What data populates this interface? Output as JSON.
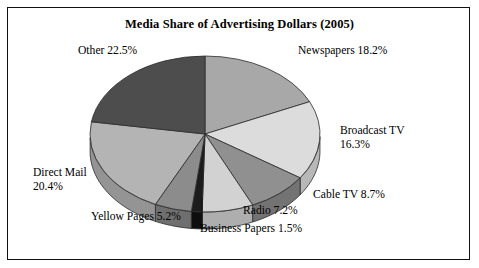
{
  "figure": {
    "title": "Media Share of Advertising Dollars (2005)",
    "frame_color": "#111111",
    "background": "#ffffff"
  },
  "labels": {
    "other": "Other 22.5%",
    "newspapers": "Newspapers 18.2%",
    "broadcast_tv_line1": "Broadcast TV",
    "broadcast_tv_line2": "16.3%",
    "cable_tv": "Cable TV 8.7%",
    "radio": "Radio 7.2%",
    "business_papers": "Business Papers 1.5%",
    "yellow_pages": "Yellow Pages 5.2%",
    "direct_mail_line1": "Direct Mail",
    "direct_mail_line2": "20.4%"
  },
  "chart_data": {
    "type": "pie",
    "title": "Media Share of Advertising Dollars (2005)",
    "xlabel": "",
    "ylabel": "",
    "three_d": true,
    "start_angle_deg": 90,
    "direction": "clockwise",
    "legend": "none",
    "labels_position": "outside",
    "grid": false,
    "categories": [
      "Newspapers",
      "Broadcast TV",
      "Cable TV",
      "Radio",
      "Business Papers",
      "Yellow Pages",
      "Direct Mail",
      "Other"
    ],
    "values": [
      18.2,
      16.3,
      8.7,
      7.2,
      1.5,
      5.2,
      20.4,
      22.5
    ],
    "units": "percent",
    "total": 100.0,
    "slices": [
      {
        "label": "Newspapers",
        "value": 18.2,
        "color": "#a8a8a8",
        "side_color": "#8a8a8a"
      },
      {
        "label": "Broadcast TV",
        "value": 16.3,
        "color": "#dcdcdc",
        "side_color": "#b8b8b8"
      },
      {
        "label": "Cable TV",
        "value": 8.7,
        "color": "#909090",
        "side_color": "#737373"
      },
      {
        "label": "Radio",
        "value": 7.2,
        "color": "#d2d2d2",
        "side_color": "#aeaeae"
      },
      {
        "label": "Business Papers",
        "value": 1.5,
        "color": "#1c1c1c",
        "side_color": "#0e0e0e"
      },
      {
        "label": "Yellow Pages",
        "value": 5.2,
        "color": "#8c8c8c",
        "side_color": "#6f6f6f"
      },
      {
        "label": "Direct Mail",
        "value": 20.4,
        "color": "#b4b4b4",
        "side_color": "#949494"
      },
      {
        "label": "Other",
        "value": 22.5,
        "color": "#4d4d4d",
        "side_color": "#3a3a3a"
      }
    ]
  }
}
